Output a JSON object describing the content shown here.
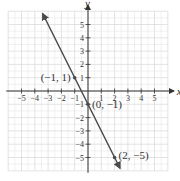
{
  "chart_data": {
    "type": "line",
    "title": "",
    "xlabel": "x",
    "ylabel": "y",
    "xlim": [
      -6,
      6
    ],
    "ylim": [
      -6,
      6
    ],
    "grid": true,
    "x_ticks": [
      -5,
      -4,
      -3,
      -2,
      -1,
      1,
      2,
      3,
      4,
      5
    ],
    "y_ticks": [
      -5,
      -4,
      -3,
      -2,
      -1,
      1,
      2,
      3,
      4,
      5
    ],
    "x_tick_labels": [
      "−5",
      "−4",
      "−3",
      "−2",
      "−1",
      "1",
      "2",
      "3",
      "4",
      "5"
    ],
    "y_tick_labels": [
      "−5",
      "−4",
      "−3",
      "−2",
      "−1",
      "1",
      "2",
      "3",
      "4",
      "5"
    ],
    "series": [
      {
        "name": "y = −2x − 1",
        "equation": "y = -2x - 1",
        "x": [
          -3.4,
          2.4
        ],
        "y": [
          5.8,
          -5.8
        ],
        "arrows_both_ends": true,
        "color": "#4a4a4a"
      }
    ],
    "points": [
      {
        "x": -1,
        "y": 1,
        "label": "(−1, 1)"
      },
      {
        "x": 0,
        "y": -1,
        "label": "(0, −1)"
      },
      {
        "x": 2,
        "y": -5,
        "label": "(2, −5)"
      }
    ]
  },
  "colors": {
    "grid": "#dcdcdc",
    "axis": "#333333",
    "line": "#4a4a4a",
    "background": "#ffffff"
  }
}
